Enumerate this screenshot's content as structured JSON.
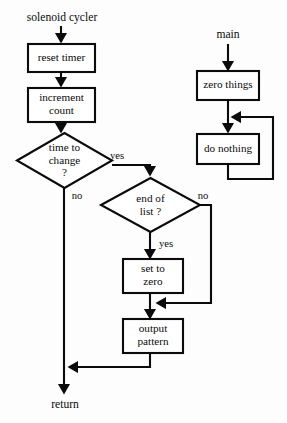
{
  "diagram": {
    "type": "flowchart",
    "background_color": "#fdfdfd",
    "stroke_color": "#0b0b0b",
    "fill_color": "#ffffff",
    "entry_points": [
      {
        "id": "entry-solenoid",
        "label": "solenoid cycler"
      },
      {
        "id": "entry-main",
        "label": "main"
      }
    ],
    "exit_points": [
      {
        "id": "exit-return",
        "label": "return"
      }
    ],
    "processes": [
      {
        "id": "reset-timer",
        "label": "reset timer"
      },
      {
        "id": "increment-count",
        "label": "increment\ncount"
      },
      {
        "id": "set-to-zero",
        "label": "set to\nzero"
      },
      {
        "id": "output-pattern",
        "label": "output\npattern"
      },
      {
        "id": "zero-things",
        "label": "zero things"
      },
      {
        "id": "do-nothing",
        "label": "do nothing"
      }
    ],
    "decisions": [
      {
        "id": "time-to-change",
        "label": "time to\nchange\n?"
      },
      {
        "id": "end-of-list",
        "label": "end of\nlist ?"
      }
    ],
    "edge_labels": [
      {
        "id": "time-to-change-yes",
        "label": "yes"
      },
      {
        "id": "time-to-change-no",
        "label": "no"
      },
      {
        "id": "end-of-list-no",
        "label": "no"
      },
      {
        "id": "end-of-list-yes",
        "label": "yes"
      }
    ]
  }
}
